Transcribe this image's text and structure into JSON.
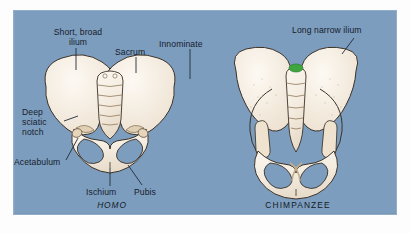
{
  "figure": {
    "background_color": "#7d9dbe",
    "bone_color": "#f4ece0",
    "outline_color": "#3a3128",
    "leader_color": "#1d2a38",
    "marker_color": "#3fa63f"
  },
  "specimens": [
    {
      "id": "homo",
      "caption": "HOMO",
      "style": "italic"
    },
    {
      "id": "chimpanzee",
      "caption": "CHIMPANZEE",
      "style": "normal"
    }
  ],
  "labels": {
    "short_broad_ilium": "Short, broad\nilium",
    "sacrum": "Sacrum",
    "innominate": "Innominate",
    "deep_sciatic_notch": "Deep\nsciatic\nnotch",
    "acetabulum": "Acetabulum",
    "ischium": "Ischium",
    "pubis": "Pubis",
    "long_narrow_ilium": "Long narrow ilium"
  },
  "anatomy_parts": [
    "ilium",
    "sacrum",
    "innominate",
    "sciatic notch",
    "acetabulum",
    "ischium",
    "pubis",
    "obturator foramen"
  ]
}
